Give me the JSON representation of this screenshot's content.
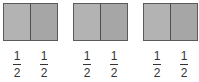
{
  "diagram": {
    "colors": {
      "left_half": "#b3b3b3",
      "right_half": "#a6a6a6",
      "border": "#5a5a5a",
      "text": "#333333"
    },
    "shapes": [
      {
        "halves": 2,
        "labels": [
          {
            "numerator": "1",
            "denominator": "2"
          },
          {
            "numerator": "1",
            "denominator": "2"
          }
        ]
      },
      {
        "halves": 2,
        "labels": [
          {
            "numerator": "1",
            "denominator": "2"
          },
          {
            "numerator": "1",
            "denominator": "2"
          }
        ]
      },
      {
        "halves": 2,
        "labels": [
          {
            "numerator": "1",
            "denominator": "2"
          },
          {
            "numerator": "1",
            "denominator": "2"
          }
        ]
      }
    ]
  }
}
